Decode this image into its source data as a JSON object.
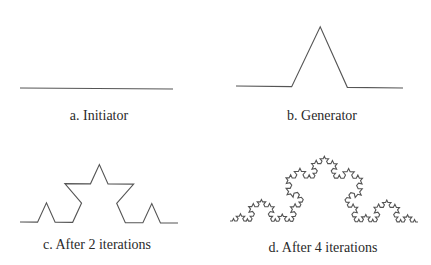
{
  "figure": {
    "panels": [
      {
        "id": "a",
        "caption": "a. Initiator",
        "iterations": 0,
        "start": [
          20,
          88
        ],
        "end": [
          173,
          89
        ],
        "height_scale": 1.25,
        "caption_pos": [
          99,
          108
        ]
      },
      {
        "id": "b",
        "caption": "b. Generator",
        "iterations": 1,
        "start": [
          236,
          86
        ],
        "end": [
          403,
          88
        ],
        "height_scale": 1.25,
        "caption_pos": [
          322,
          108
        ]
      },
      {
        "id": "c",
        "caption": "c. After 2 iterations",
        "iterations": 2,
        "start": [
          20,
          222
        ],
        "end": [
          178,
          223
        ],
        "height_scale": 1.27,
        "caption_pos": [
          97,
          237
        ]
      },
      {
        "id": "d",
        "caption": "d. After 4 iterations",
        "iterations": 4,
        "start": [
          230,
          221
        ],
        "end": [
          418,
          222
        ],
        "height_scale": 1.2,
        "caption_pos": [
          323,
          240
        ]
      }
    ],
    "stroke_color": "#555555",
    "caption_color": "#2a2a2a"
  }
}
